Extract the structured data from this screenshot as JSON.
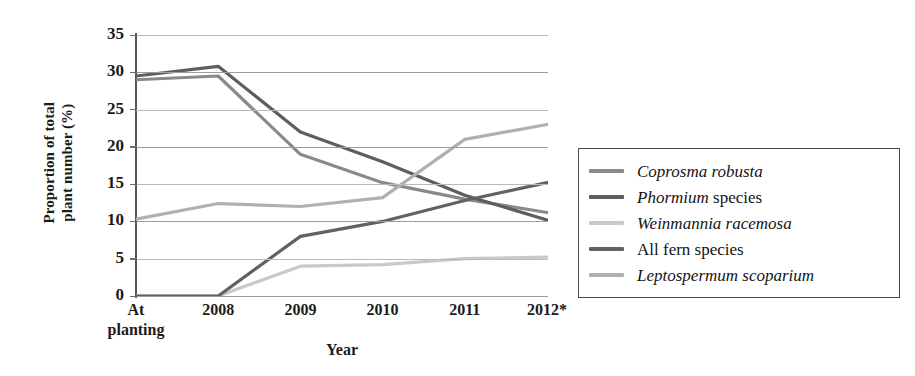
{
  "chart_data": {
    "type": "line",
    "title": "",
    "xlabel": "Year",
    "ylabel": "Proportion of total plant number (%)",
    "ylabel_lines": [
      "Proportion of total",
      "plant number (%)"
    ],
    "categories": [
      "At planting",
      "2008",
      "2009",
      "2010",
      "2011",
      "2012*"
    ],
    "category_lines": [
      [
        "At",
        "planting"
      ],
      [
        "2008",
        ""
      ],
      [
        "2009",
        ""
      ],
      [
        "2010",
        ""
      ],
      [
        "2011",
        ""
      ],
      [
        "2012*",
        ""
      ]
    ],
    "ylim": [
      0,
      35
    ],
    "ytick_step": 5,
    "yticks": [
      "0",
      "5",
      "10",
      "15",
      "20",
      "25",
      "30",
      "35"
    ],
    "grid": true,
    "legend_position": "right-outside",
    "series": [
      {
        "name": "Coprosma robusta",
        "name_italic": "Coprosma robusta",
        "name_roman": "",
        "color": "#8a8a8a",
        "values": [
          29.0,
          29.5,
          19.0,
          15.2,
          13.0,
          11.2
        ]
      },
      {
        "name": "Phormium species",
        "name_italic": "Phormium",
        "name_roman": " species",
        "color": "#5e5e5e",
        "values": [
          29.5,
          30.8,
          22.0,
          18.0,
          13.5,
          10.2
        ]
      },
      {
        "name": "Weinmannia racemosa",
        "name_italic": "Weinmannia racemosa",
        "name_roman": "",
        "color": "#c9c9c9",
        "values": [
          0.0,
          0.0,
          4.0,
          4.2,
          5.0,
          5.2
        ]
      },
      {
        "name": "All fern species",
        "name_italic": "",
        "name_roman": "All fern species",
        "color": "#626262",
        "values": [
          0.0,
          0.0,
          8.0,
          10.0,
          12.8,
          15.2
        ]
      },
      {
        "name": "Leptospermum scoparium",
        "name_italic": "Leptospermum scoparium",
        "name_roman": "",
        "color": "#b0b0b0",
        "values": [
          10.3,
          12.4,
          12.0,
          13.2,
          21.0,
          23.0
        ]
      }
    ]
  },
  "axes": {
    "x_title": "Year",
    "y_title_line1": "Proportion of total",
    "y_title_line2": "plant number (%)"
  }
}
